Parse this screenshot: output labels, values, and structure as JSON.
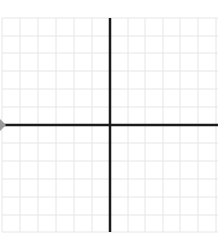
{
  "diagram": {
    "type": "coordinate-grid",
    "title": "",
    "grid": {
      "x_lines": [
        2,
        20,
        38,
        56,
        74,
        92,
        128,
        145,
        163,
        180,
        198,
        216
      ],
      "y_lines": [
        18,
        36,
        53,
        71,
        89,
        107,
        143,
        161,
        179,
        197,
        215,
        232
      ],
      "color": "#e6e6e6",
      "left": 2,
      "right": 218,
      "top": 18,
      "bottom": 232
    },
    "axes": {
      "color": "#1a1a1a",
      "x_axis_y": 125,
      "y_axis_x": 110,
      "x_axis_left": 4,
      "x_axis_right": 218,
      "y_axis_top": 18,
      "y_axis_bottom": 232,
      "left_marker_color": "#9a9a9a"
    }
  }
}
